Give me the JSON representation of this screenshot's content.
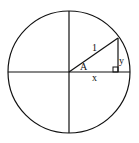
{
  "diagram": {
    "type": "unit-circle-trig",
    "labels": {
      "hypotenuse": "1",
      "opposite": "y",
      "adjacent": "x",
      "angle": "A"
    },
    "stroke_color": "#111111",
    "background": "#ffffff"
  }
}
